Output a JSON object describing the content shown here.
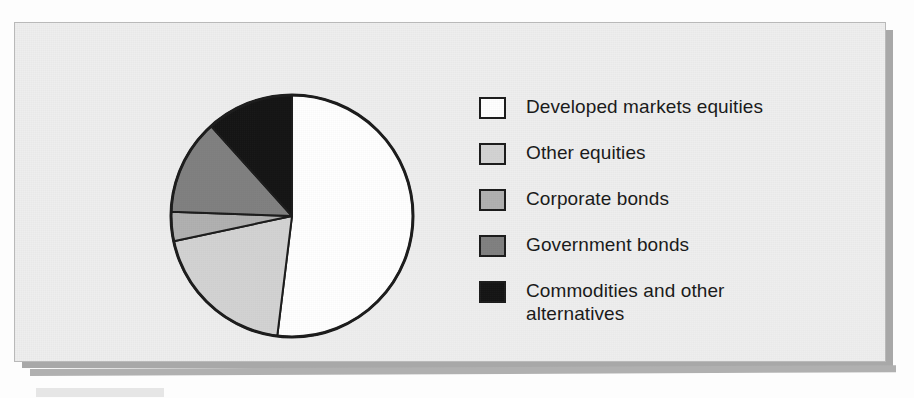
{
  "figure": {
    "frame_border_color": "#b9b9b9",
    "frame_background": "#eeeeee",
    "shadow_color": "#a8a8a8"
  },
  "chart_data": {
    "type": "pie",
    "title": "",
    "subtitle": "",
    "xlabel": "",
    "ylabel": "",
    "legend_position": "right",
    "grid": false,
    "start_angle_deg": 0,
    "direction": "clockwise",
    "categories": [
      "Developed markets equities",
      "Other equities",
      "Corporate bonds",
      "Government bonds",
      "Commodities and other alternatives"
    ],
    "values": [
      52,
      20,
      4,
      13,
      11
    ],
    "units": "percent",
    "slice_colors": [
      "#ffffff",
      "#d2d2d2",
      "#b0b0b0",
      "#808080",
      "#141414"
    ],
    "slice_edge_color": "#1b1b1b",
    "slices": [
      {
        "label": "Developed markets equities",
        "value": 52,
        "color": "#ffffff",
        "start_angle_deg": 0,
        "end_angle_deg": 187
      },
      {
        "label": "Other equities",
        "value": 20,
        "color": "#d2d2d2",
        "start_angle_deg": 187,
        "end_angle_deg": 258
      },
      {
        "label": "Corporate bonds",
        "value": 4,
        "color": "#b0b0b0",
        "start_angle_deg": 258,
        "end_angle_deg": 272
      },
      {
        "label": "Government bonds",
        "value": 13,
        "color": "#808080",
        "start_angle_deg": 272,
        "end_angle_deg": 318
      },
      {
        "label": "Commodities and other alternatives",
        "value": 11,
        "color": "#141414",
        "start_angle_deg": 318,
        "end_angle_deg": 360
      }
    ]
  },
  "legend": {
    "items": [
      {
        "label": "Developed markets equities",
        "color": "#ffffff"
      },
      {
        "label": "Other equities",
        "color": "#d2d2d2"
      },
      {
        "label": "Corporate bonds",
        "color": "#b0b0b0"
      },
      {
        "label": "Government bonds",
        "color": "#808080"
      },
      {
        "label": "Commodities and other\nalternatives",
        "color": "#141414"
      }
    ]
  }
}
